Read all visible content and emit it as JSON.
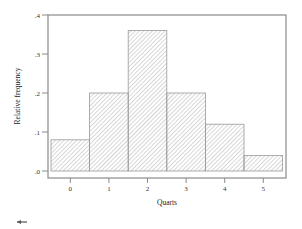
{
  "chart_data": {
    "type": "bar",
    "title": "",
    "xlabel": "Quarts",
    "ylabel": "Relative frequency",
    "categories": [
      "0",
      "1",
      "2",
      "3",
      "4",
      "5"
    ],
    "values": [
      0.08,
      0.2,
      0.36,
      0.2,
      0.12,
      0.04
    ],
    "ylim": [
      0,
      0.4
    ],
    "yticks": [
      ".0",
      ".1",
      ".2",
      ".3",
      ".4"
    ],
    "ytick_values": [
      0,
      0.1,
      0.2,
      0.3,
      0.4
    ],
    "grid": false,
    "legend": null,
    "bar_style": "diagonal hatch, gray outline, no gaps (histogram)"
  },
  "colors": {
    "frame": "#8a8a8a",
    "bar_outline": "#9a9a9a",
    "hatch": "#b0b0b0",
    "text": "#333333"
  }
}
